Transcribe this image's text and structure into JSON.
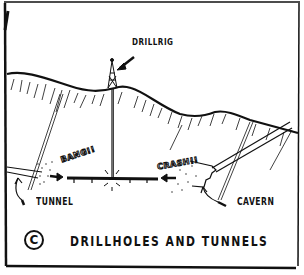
{
  "illustration": {
    "style": "hand-drawn cartoon cross-section",
    "labels": {
      "drillrig": "DRILLRIG",
      "tunnel": "TUNNEL",
      "cavern": "CAVERN"
    },
    "sound_effects": {
      "left": "BANG!!",
      "right": "CRASH!!"
    },
    "caption": {
      "copyright_symbol": "C",
      "text": "DRILLHOLES AND TUNNELS"
    },
    "colors": {
      "ink": "#111111",
      "paper": "#ffffff"
    }
  }
}
